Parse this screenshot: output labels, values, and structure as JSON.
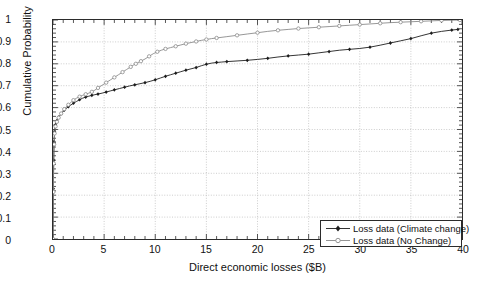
{
  "chart_data": {
    "type": "line",
    "title": "",
    "xlabel": "Direct economic losses ($B)",
    "ylabel": "Cumulative Probability",
    "xlim": [
      0,
      40
    ],
    "ylim": [
      0,
      1
    ],
    "xticks": [
      0,
      5,
      10,
      15,
      20,
      25,
      30,
      35,
      40
    ],
    "xtick_labels": [
      "0",
      "5",
      "10",
      "15",
      "20",
      "25",
      "30",
      "35",
      "40"
    ],
    "yticks": [
      0,
      0.1,
      0.2,
      0.3,
      0.4,
      0.5,
      0.6,
      0.7,
      0.8,
      0.9,
      1
    ],
    "ytick_labels": [
      "0",
      "0.1",
      "0.2",
      "0.3",
      "0.4",
      "0.5",
      "0.6",
      "0.7",
      "0.8",
      "0.9",
      "1"
    ],
    "grid": true,
    "minor_xtick_interval": 1,
    "legend_position": "lower right",
    "series": [
      {
        "name": "Loss data (Climate change)",
        "color": "#1c1c1c",
        "marker": "filled-diamond",
        "points": [
          [
            0.0,
            0.0
          ],
          [
            0.02,
            0.12
          ],
          [
            0.04,
            0.23
          ],
          [
            0.05,
            0.3
          ],
          [
            0.07,
            0.36
          ],
          [
            0.09,
            0.41
          ],
          [
            0.11,
            0.445
          ],
          [
            0.13,
            0.47
          ],
          [
            0.16,
            0.492
          ],
          [
            0.2,
            0.51
          ],
          [
            0.25,
            0.522
          ],
          [
            0.31,
            0.532
          ],
          [
            0.38,
            0.54
          ],
          [
            0.46,
            0.548
          ],
          [
            0.55,
            0.556
          ],
          [
            0.66,
            0.563
          ],
          [
            0.8,
            0.572
          ],
          [
            0.95,
            0.58
          ],
          [
            1.1,
            0.588
          ],
          [
            1.3,
            0.596
          ],
          [
            1.5,
            0.604
          ],
          [
            1.75,
            0.612
          ],
          [
            2.0,
            0.62
          ],
          [
            2.3,
            0.628
          ],
          [
            2.6,
            0.636
          ],
          [
            2.9,
            0.643
          ],
          [
            3.2,
            0.648
          ],
          [
            3.5,
            0.652
          ],
          [
            3.8,
            0.656
          ],
          [
            4.1,
            0.659
          ],
          [
            4.4,
            0.662
          ],
          [
            4.8,
            0.666
          ],
          [
            5.2,
            0.671
          ],
          [
            5.6,
            0.676
          ],
          [
            6.0,
            0.681
          ],
          [
            6.5,
            0.687
          ],
          [
            7.0,
            0.693
          ],
          [
            7.5,
            0.699
          ],
          [
            8.0,
            0.704
          ],
          [
            8.5,
            0.709
          ],
          [
            9.0,
            0.714
          ],
          [
            9.5,
            0.72
          ],
          [
            10.0,
            0.727
          ],
          [
            10.5,
            0.735
          ],
          [
            11.0,
            0.743
          ],
          [
            11.5,
            0.75
          ],
          [
            12.0,
            0.757
          ],
          [
            12.5,
            0.764
          ],
          [
            13.0,
            0.771
          ],
          [
            13.5,
            0.777
          ],
          [
            14.0,
            0.783
          ],
          [
            14.5,
            0.791
          ],
          [
            15.0,
            0.798
          ],
          [
            15.5,
            0.803
          ],
          [
            16.0,
            0.806
          ],
          [
            16.5,
            0.808
          ],
          [
            17.0,
            0.81
          ],
          [
            18.0,
            0.813
          ],
          [
            19.0,
            0.816
          ],
          [
            20.0,
            0.82
          ],
          [
            21.0,
            0.825
          ],
          [
            22.0,
            0.831
          ],
          [
            23.0,
            0.836
          ],
          [
            24.0,
            0.84
          ],
          [
            25.0,
            0.844
          ],
          [
            26.0,
            0.85
          ],
          [
            27.0,
            0.856
          ],
          [
            28.0,
            0.862
          ],
          [
            29.0,
            0.866
          ],
          [
            30.0,
            0.87
          ],
          [
            31.0,
            0.876
          ],
          [
            32.0,
            0.885
          ],
          [
            33.0,
            0.895
          ],
          [
            34.0,
            0.905
          ],
          [
            35.0,
            0.915
          ],
          [
            36.0,
            0.928
          ],
          [
            37.0,
            0.94
          ],
          [
            38.0,
            0.948
          ],
          [
            39.0,
            0.954
          ],
          [
            39.6,
            0.957
          ]
        ]
      },
      {
        "name": "Loss data (No Change)",
        "color": "#8a8a8a",
        "marker": "open-circle",
        "points": [
          [
            0.0,
            0.0
          ],
          [
            0.02,
            0.11
          ],
          [
            0.04,
            0.215
          ],
          [
            0.05,
            0.285
          ],
          [
            0.07,
            0.345
          ],
          [
            0.09,
            0.395
          ],
          [
            0.11,
            0.432
          ],
          [
            0.13,
            0.46
          ],
          [
            0.16,
            0.482
          ],
          [
            0.2,
            0.5
          ],
          [
            0.25,
            0.514
          ],
          [
            0.31,
            0.525
          ],
          [
            0.38,
            0.535
          ],
          [
            0.46,
            0.545
          ],
          [
            0.55,
            0.554
          ],
          [
            0.66,
            0.563
          ],
          [
            0.8,
            0.573
          ],
          [
            0.95,
            0.583
          ],
          [
            1.1,
            0.593
          ],
          [
            1.3,
            0.603
          ],
          [
            1.5,
            0.613
          ],
          [
            1.75,
            0.624
          ],
          [
            2.0,
            0.634
          ],
          [
            2.3,
            0.643
          ],
          [
            2.6,
            0.65
          ],
          [
            2.9,
            0.656
          ],
          [
            3.2,
            0.661
          ],
          [
            3.5,
            0.666
          ],
          [
            3.8,
            0.672
          ],
          [
            4.1,
            0.68
          ],
          [
            4.4,
            0.69
          ],
          [
            4.8,
            0.702
          ],
          [
            5.2,
            0.714
          ],
          [
            5.6,
            0.726
          ],
          [
            6.0,
            0.738
          ],
          [
            6.4,
            0.75
          ],
          [
            6.8,
            0.762
          ],
          [
            7.2,
            0.774
          ],
          [
            7.6,
            0.786
          ],
          [
            7.9,
            0.795
          ],
          [
            8.1,
            0.8
          ],
          [
            8.3,
            0.805
          ],
          [
            8.6,
            0.812
          ],
          [
            9.0,
            0.822
          ],
          [
            9.4,
            0.834
          ],
          [
            9.8,
            0.846
          ],
          [
            10.2,
            0.855
          ],
          [
            10.6,
            0.862
          ],
          [
            11.0,
            0.868
          ],
          [
            11.5,
            0.874
          ],
          [
            12.0,
            0.88
          ],
          [
            12.5,
            0.886
          ],
          [
            13.0,
            0.892
          ],
          [
            13.5,
            0.897
          ],
          [
            14.0,
            0.902
          ],
          [
            14.5,
            0.907
          ],
          [
            15.0,
            0.911
          ],
          [
            15.5,
            0.915
          ],
          [
            16.0,
            0.918
          ],
          [
            17.0,
            0.924
          ],
          [
            18.0,
            0.93
          ],
          [
            19.0,
            0.936
          ],
          [
            20.0,
            0.942
          ],
          [
            21.0,
            0.948
          ],
          [
            22.0,
            0.953
          ],
          [
            23.0,
            0.957
          ],
          [
            24.0,
            0.961
          ],
          [
            25.0,
            0.964
          ],
          [
            26.0,
            0.967
          ],
          [
            27.0,
            0.97
          ],
          [
            28.0,
            0.973
          ],
          [
            29.0,
            0.976
          ],
          [
            30.0,
            0.979
          ],
          [
            31.0,
            0.982
          ],
          [
            32.0,
            0.985
          ],
          [
            33.0,
            0.988
          ],
          [
            34.0,
            0.99
          ],
          [
            35.0,
            0.992
          ],
          [
            36.0,
            0.994
          ],
          [
            37.0,
            0.996
          ],
          [
            38.0,
            0.998
          ],
          [
            39.0,
            0.999
          ],
          [
            39.8,
            1.0
          ]
        ]
      }
    ]
  },
  "legend": {
    "items": [
      {
        "label": "Loss data (Climate change)"
      },
      {
        "label": "Loss data (No Change)"
      }
    ]
  }
}
